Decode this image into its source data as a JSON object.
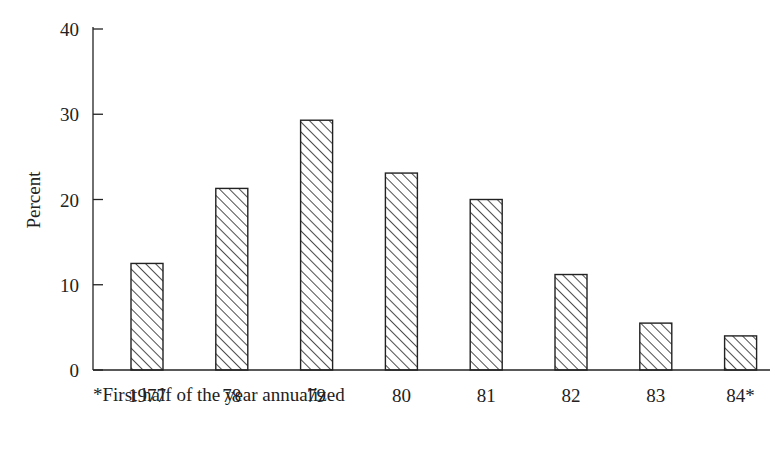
{
  "chart_data": {
    "type": "bar",
    "title": "",
    "xlabel": "",
    "ylabel": "Percent",
    "ylim": [
      0,
      40
    ],
    "yticks": [
      0,
      10,
      20,
      30,
      40
    ],
    "categories": [
      "1977",
      "78",
      "79",
      "80",
      "81",
      "82",
      "83",
      "84*"
    ],
    "values": [
      12.5,
      21.3,
      29.3,
      23.1,
      20.0,
      11.2,
      5.5,
      4.0
    ],
    "grid": false,
    "legend": null,
    "bar_fill": "diagonal-hatch",
    "bar_color": "#222222",
    "annotations": [
      "*First half of the year annualized"
    ]
  },
  "footnote": "*First half of the year annualized"
}
